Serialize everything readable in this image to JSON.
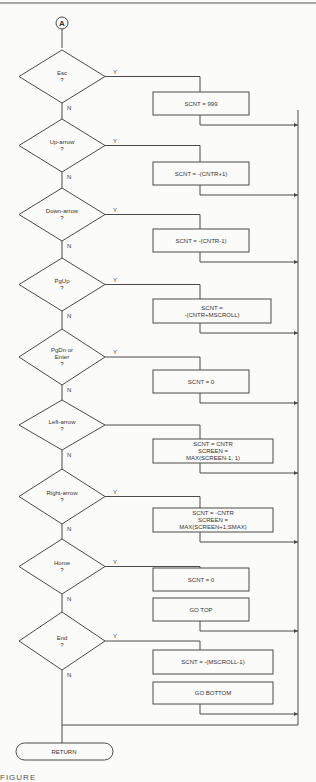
{
  "connector": {
    "label": "A"
  },
  "branch_labels": {
    "yes": "Y",
    "no": "N"
  },
  "decisions": [
    {
      "lines": [
        "Esc",
        "?"
      ],
      "yes_label": "Y",
      "actions": [
        [
          "SCNT = 999"
        ]
      ]
    },
    {
      "lines": [
        "Up-arrow",
        "?"
      ],
      "yes_label": "Y",
      "actions": [
        [
          "SCNT = -(CNTR+1)"
        ]
      ]
    },
    {
      "lines": [
        "Down-arrow",
        "?"
      ],
      "yes_label": "Y",
      "actions": [
        [
          "SCNT = -(CNTR-1)"
        ]
      ]
    },
    {
      "lines": [
        "PgUp",
        "?"
      ],
      "yes_label": "Y",
      "actions": [
        [
          "SCNT =",
          "-(CNTR+MSCROLL)"
        ]
      ]
    },
    {
      "lines": [
        "PgDn or",
        "Enter",
        "?"
      ],
      "yes_label": "Y",
      "actions": [
        [
          "SCNT = 0"
        ]
      ]
    },
    {
      "lines": [
        "Left-arrow",
        "?"
      ],
      "yes_label": "",
      "actions": [
        [
          "SCNT = CNTR",
          "SCREEN =",
          "MAX(SCREEN-1, 1)"
        ]
      ]
    },
    {
      "lines": [
        "Right-arrow",
        "?"
      ],
      "yes_label": "Y",
      "actions": [
        [
          "SCNT = -CNTR",
          "SCREEN =",
          "MAX(SCREEN+1,SMAX)"
        ]
      ]
    },
    {
      "lines": [
        "Home",
        "?"
      ],
      "yes_label": "Y",
      "actions": [
        [
          "SCNT = 0"
        ],
        [
          "GO TOP"
        ]
      ]
    },
    {
      "lines": [
        "End",
        "?"
      ],
      "yes_label": "Y",
      "actions": [
        [
          "SCNT = -(MSCROLL-1)"
        ],
        [
          "GO BOTTOM"
        ]
      ]
    }
  ],
  "terminal": {
    "label": "RETURN"
  },
  "caption": "FIGURE"
}
